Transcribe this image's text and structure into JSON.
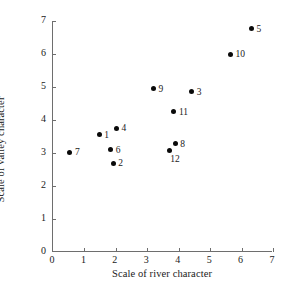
{
  "chart_data": {
    "type": "scatter",
    "title": "",
    "xlabel": "Scale of river character",
    "ylabel": "Scale of valley character",
    "xlim": [
      0,
      7
    ],
    "ylim": [
      0,
      7
    ],
    "xticks": [
      "0",
      "1",
      "2",
      "3",
      "4",
      "5",
      "6",
      "7"
    ],
    "yticks": [
      "0",
      "1",
      "2",
      "3",
      "4",
      "5",
      "6",
      "7"
    ],
    "grid": false,
    "legend": "none",
    "marker_color": "#0a0a0a",
    "axis_color": "#6e6e6e",
    "points": [
      {
        "label": "1",
        "x": 1.5,
        "y": 3.55,
        "label_pos": "right"
      },
      {
        "label": "2",
        "x": 1.95,
        "y": 2.69,
        "label_pos": "right"
      },
      {
        "label": "3",
        "x": 4.45,
        "y": 4.85,
        "label_pos": "right"
      },
      {
        "label": "4",
        "x": 2.05,
        "y": 3.75,
        "label_pos": "right"
      },
      {
        "label": "5",
        "x": 6.35,
        "y": 6.77,
        "label_pos": "right"
      },
      {
        "label": "6",
        "x": 1.87,
        "y": 3.1,
        "label_pos": "right"
      },
      {
        "label": "7",
        "x": 0.57,
        "y": 3.03,
        "label_pos": "right"
      },
      {
        "label": "8",
        "x": 3.92,
        "y": 3.28,
        "label_pos": "right"
      },
      {
        "label": "9",
        "x": 3.23,
        "y": 4.95,
        "label_pos": "right"
      },
      {
        "label": "10",
        "x": 5.68,
        "y": 6.0,
        "label_pos": "right"
      },
      {
        "label": "11",
        "x": 3.88,
        "y": 4.25,
        "label_pos": "right"
      },
      {
        "label": "12",
        "x": 3.73,
        "y": 3.08,
        "label_pos": "below"
      }
    ]
  }
}
